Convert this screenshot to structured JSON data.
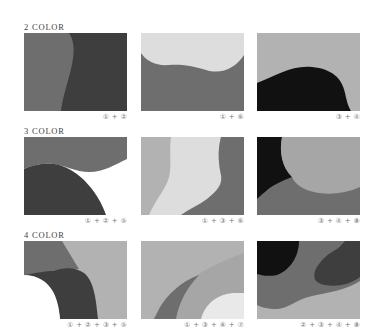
{
  "sections": [
    {
      "label": "2 COLOR",
      "swatches": [
        {
          "caption": "① + ②"
        },
        {
          "caption": "① + ⑥"
        },
        {
          "caption": "③ + ④"
        }
      ]
    },
    {
      "label": "3 COLOR",
      "swatches": [
        {
          "caption": "① + ② + ⑤"
        },
        {
          "caption": "① + ③ + ⑥"
        },
        {
          "caption": "③ + ④ + ⑧"
        }
      ]
    },
    {
      "label": "4 COLOR",
      "swatches": [
        {
          "caption": "① + ② + ③ + ⑤"
        },
        {
          "caption": "① + ③ + ⑥ + ⑦"
        },
        {
          "caption": "② + ③ + ④ + ⑧"
        }
      ]
    }
  ],
  "colors": {
    "c1": "#6e6e6e",
    "c2": "#3e3e3e",
    "c3": "#b2b2b2",
    "c4": "#111111",
    "c5": "#ffffff",
    "c6": "#dddddd",
    "c7": "#e9e9e9",
    "c8": "#a6a6a6"
  }
}
